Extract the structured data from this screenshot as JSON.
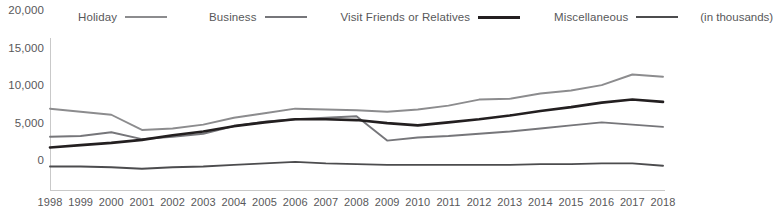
{
  "legend": {
    "items": [
      {
        "label": "Holiday",
        "color": "#8c8c8e",
        "icon": "line-swatch-icon"
      },
      {
        "label": "Business",
        "color": "#76767a",
        "icon": "line-swatch-icon"
      },
      {
        "label": "Visit Friends or Relatives",
        "color": "#231f20",
        "icon": "line-swatch-icon"
      },
      {
        "label": "Miscellaneous",
        "color": "#4c4c4e",
        "icon": "line-swatch-icon"
      }
    ],
    "note": "(in thousands)"
  },
  "axis": {
    "y_ticks": [
      "0",
      "5,000",
      "10,000",
      "15,000",
      "20,000"
    ],
    "x_ticks": [
      "1998",
      "1999",
      "2000",
      "2001",
      "2002",
      "2003",
      "2004",
      "2005",
      "2006",
      "2007",
      "2008",
      "2009",
      "2010",
      "2011",
      "2012",
      "2013",
      "2014",
      "2015",
      "2016",
      "2017",
      "2018"
    ]
  },
  "chart_data": {
    "type": "line",
    "title": "",
    "subtitle": "",
    "xlabel": "",
    "ylabel": "(in thousands)",
    "ylim": [
      0,
      20000
    ],
    "ytick_values": [
      0,
      5000,
      10000,
      15000,
      20000
    ],
    "grid": false,
    "legend_position": "top",
    "annotations": [
      "(in thousands)"
    ],
    "categories": [
      "1998",
      "1999",
      "2000",
      "2001",
      "2002",
      "2003",
      "2004",
      "2005",
      "2006",
      "2007",
      "2008",
      "2009",
      "2010",
      "2011",
      "2012",
      "2013",
      "2014",
      "2015",
      "2016",
      "2017",
      "2018"
    ],
    "series": [
      {
        "name": "Holiday",
        "color": "#8c8c8e",
        "values": [
          10700,
          10300,
          9900,
          7900,
          8100,
          8600,
          9500,
          10100,
          10700,
          10600,
          10500,
          10300,
          10600,
          11100,
          11900,
          12000,
          12700,
          13100,
          13800,
          15200,
          14900
        ]
      },
      {
        "name": "Business",
        "color": "#76767a",
        "values": [
          7000,
          7100,
          7600,
          6700,
          7000,
          7400,
          8400,
          9000,
          9300,
          9500,
          9700,
          6500,
          6900,
          7100,
          7400,
          7700,
          8100,
          8500,
          8900,
          8600,
          8300
        ]
      },
      {
        "name": "Visit Friends or Relatives",
        "color": "#231f20",
        "values": [
          5600,
          5900,
          6200,
          6600,
          7200,
          7700,
          8400,
          8900,
          9300,
          9300,
          9200,
          8800,
          8500,
          8900,
          9300,
          9800,
          10400,
          10900,
          11500,
          11900,
          11600
        ]
      },
      {
        "name": "Miscellaneous",
        "color": "#4c4c4e",
        "values": [
          3100,
          3100,
          3000,
          2800,
          3000,
          3100,
          3300,
          3500,
          3700,
          3500,
          3400,
          3300,
          3300,
          3300,
          3300,
          3300,
          3400,
          3400,
          3500,
          3500,
          3200
        ]
      }
    ]
  }
}
